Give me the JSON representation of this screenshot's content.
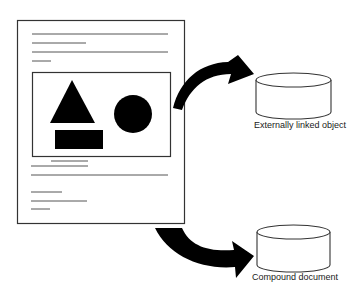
{
  "diagram": {
    "colors": {
      "stroke": "#333333",
      "fill": "#000000",
      "background": "#ffffff"
    },
    "document": {
      "text_lines_top": 4,
      "embedded_shapes": [
        "triangle",
        "circle",
        "rectangle"
      ],
      "text_lines_bottom": 6
    },
    "targets": [
      {
        "label": "Externally linked object",
        "icon": "cylinder-icon"
      },
      {
        "label": "Compound document",
        "icon": "cylinder-icon"
      }
    ]
  }
}
